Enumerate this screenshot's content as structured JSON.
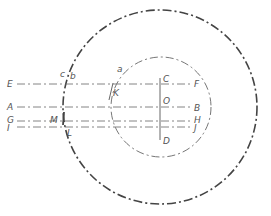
{
  "diagram": {
    "type": "geometric-construction",
    "outer_circle": {
      "cx": 160,
      "cy": 107,
      "r": 97
    },
    "inner_circle": {
      "cx": 161,
      "cy": 107,
      "r": 50
    },
    "labels": {
      "E": "E",
      "F": "F",
      "A": "A",
      "B": "B",
      "G": "G",
      "H": "H",
      "I": "I",
      "J": "J",
      "C": "C",
      "D": "D",
      "O": "O",
      "K": "K",
      "L": "L",
      "M": "M",
      "a": "a",
      "b": "b",
      "c": "c"
    },
    "lines": [
      {
        "name": "E-F",
        "y": 84
      },
      {
        "name": "A-B",
        "y": 107
      },
      {
        "name": "G-H",
        "y": 121
      },
      {
        "name": "I-J",
        "y": 127
      }
    ],
    "colors": {
      "stroke": "#555555",
      "background": "#ffffff"
    }
  }
}
